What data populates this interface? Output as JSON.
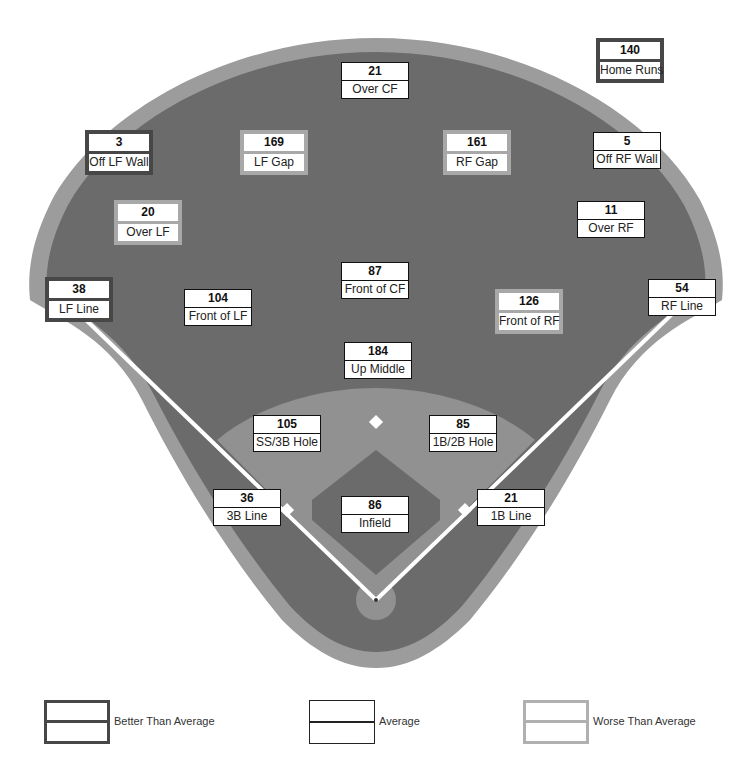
{
  "colors": {
    "grass": "#6b6b6b",
    "warning_track": "#9c9c9c",
    "infield_dirt": "#919191",
    "foul_line": "#ffffff",
    "better_border": "#474747",
    "average_border": "#111111",
    "worse_border": "#a8a8a8"
  },
  "zones": [
    {
      "id": "home-runs",
      "label": "Home Runs",
      "value": "140",
      "rating": "better",
      "x": 596,
      "y": 38
    },
    {
      "id": "over-cf",
      "label": "Over CF",
      "value": "21",
      "rating": "average",
      "x": 341,
      "y": 62
    },
    {
      "id": "off-lf-wall",
      "label": "Off LF Wall",
      "value": "3",
      "rating": "better",
      "x": 85,
      "y": 130
    },
    {
      "id": "lf-gap",
      "label": "LF Gap",
      "value": "169",
      "rating": "worse",
      "x": 240,
      "y": 130
    },
    {
      "id": "rf-gap",
      "label": "RF Gap",
      "value": "161",
      "rating": "worse",
      "x": 443,
      "y": 130
    },
    {
      "id": "off-rf-wall",
      "label": "Off RF Wall",
      "value": "5",
      "rating": "average",
      "x": 593,
      "y": 132
    },
    {
      "id": "over-lf",
      "label": "Over LF",
      "value": "20",
      "rating": "worse",
      "x": 114,
      "y": 200
    },
    {
      "id": "over-rf",
      "label": "Over RF",
      "value": "11",
      "rating": "average",
      "x": 577,
      "y": 201
    },
    {
      "id": "lf-line",
      "label": "LF Line",
      "value": "38",
      "rating": "better",
      "x": 45,
      "y": 277
    },
    {
      "id": "front-of-cf",
      "label": "Front of CF",
      "value": "87",
      "rating": "average",
      "x": 341,
      "y": 262
    },
    {
      "id": "rf-line",
      "label": "RF Line",
      "value": "54",
      "rating": "average",
      "x": 648,
      "y": 279
    },
    {
      "id": "front-of-lf",
      "label": "Front of LF",
      "value": "104",
      "rating": "average",
      "x": 184,
      "y": 289
    },
    {
      "id": "front-of-rf",
      "label": "Front of RF",
      "value": "126",
      "rating": "worse",
      "x": 495,
      "y": 289
    },
    {
      "id": "up-middle",
      "label": "Up Middle",
      "value": "184",
      "rating": "average",
      "x": 344,
      "y": 342
    },
    {
      "id": "ss-3b-hole",
      "label": "SS/3B Hole",
      "value": "105",
      "rating": "average",
      "x": 253,
      "y": 415
    },
    {
      "id": "1b-2b-hole",
      "label": "1B/2B Hole",
      "value": "85",
      "rating": "average",
      "x": 429,
      "y": 415
    },
    {
      "id": "3b-line",
      "label": "3B Line",
      "value": "36",
      "rating": "average",
      "x": 213,
      "y": 489
    },
    {
      "id": "infield",
      "label": "Infield",
      "value": "86",
      "rating": "average",
      "x": 341,
      "y": 496
    },
    {
      "id": "1b-line",
      "label": "1B Line",
      "value": "21",
      "rating": "average",
      "x": 477,
      "y": 489
    }
  ],
  "legend": [
    {
      "rating": "better",
      "label": "Better Than Average"
    },
    {
      "rating": "average",
      "label": "Average"
    },
    {
      "rating": "worse",
      "label": "Worse Than Average"
    }
  ]
}
